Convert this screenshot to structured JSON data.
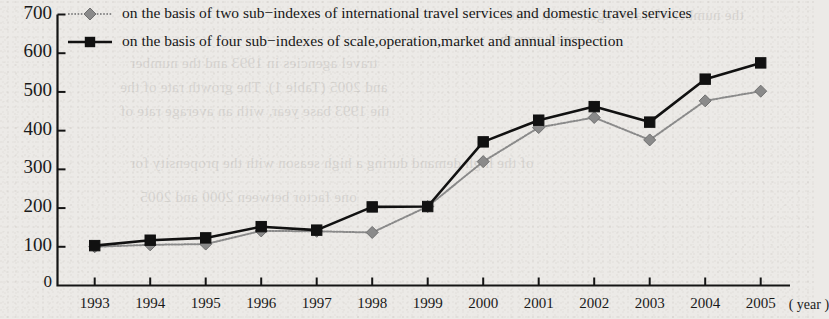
{
  "chart_data": {
    "type": "line",
    "title": "",
    "xlabel": "( year )",
    "ylabel": "",
    "categories": [
      "1993",
      "1994",
      "1995",
      "1996",
      "1997",
      "1998",
      "1999",
      "2000",
      "2001",
      "2002",
      "2003",
      "2004",
      "2005"
    ],
    "ylim": [
      0,
      700
    ],
    "yticks": [
      0,
      100,
      200,
      300,
      400,
      500,
      600,
      700
    ],
    "ytick_labels": [
      "0",
      "100",
      "200",
      "300",
      "400",
      "500",
      "600",
      "700"
    ],
    "grid": false,
    "legend_position": "top-left-inside",
    "series": [
      {
        "name": "on the basis of two sub−indexes of international travel services and domestic travel services",
        "marker": "diamond",
        "color": "#8a8a8a",
        "line_style": "dotted",
        "values": [
          100,
          105,
          107,
          141,
          140,
          137,
          204,
          320,
          408,
          434,
          376,
          477,
          502
        ]
      },
      {
        "name": "on the basis of four sub−indexes of scale,operation,market and annual inspection",
        "marker": "square",
        "color": "#111111",
        "line_style": "solid",
        "values": [
          103,
          117,
          123,
          152,
          143,
          203,
          204,
          371,
          427,
          462,
          422,
          533,
          575
        ]
      }
    ]
  },
  "axis": {
    "x_unit_label": "( year )",
    "origin_label": "0"
  },
  "legend": {
    "items": [
      {
        "label": "on the basis of two sub−indexes of international travel services and domestic travel services",
        "marker": "diamond-marker-icon"
      },
      {
        "label": "on the basis of four sub−indexes of scale,operation,market and annual inspection",
        "marker": "square-marker-icon"
      }
    ]
  },
  "background_ghost_text": {
    "lines": [
      "the number of travel agencies in China",
      "rapid growth",
      "travel agencies in 1993 and the number",
      "and 2005 (Table 1). The growth rate of the",
      "the 1993 base year, with an average rate of",
      "of the high demand during a high season with the propensity for",
      "one factor  between 2000 and 2005"
    ]
  }
}
